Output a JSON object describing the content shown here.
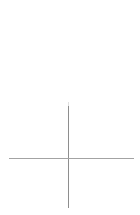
{
  "figure": {
    "title": "",
    "background_color": "#ffffff",
    "width": 140,
    "height": 215
  },
  "chart_data": {
    "type": "line",
    "title": "",
    "subtitle": "",
    "xlabel": "",
    "ylabel": "",
    "grid": false,
    "legend": null,
    "legend_position": "none",
    "annotations": [],
    "tick_labels": {
      "x": [],
      "y": []
    },
    "origin": {
      "x": 68,
      "y": 158
    },
    "series": [
      {
        "name": "vertical-axis",
        "orientation": "vertical",
        "color": "#8e8e8e",
        "stroke_width": 1,
        "x": [
          68,
          68
        ],
        "y": [
          106,
          208
        ],
        "faint_cap_top_y": 102
      },
      {
        "name": "horizontal-axis",
        "orientation": "horizontal",
        "color": "#a3a3a3",
        "stroke_width": 1,
        "x": [
          9,
          134
        ],
        "y": [
          158,
          158
        ]
      }
    ],
    "xlim": [
      0,
      140
    ],
    "ylim": [
      0,
      215
    ]
  }
}
